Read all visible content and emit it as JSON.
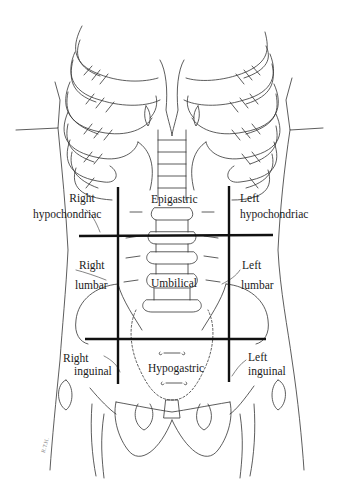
{
  "figure": {
    "type": "anatomical-diagram",
    "line_color": "#111111",
    "background": "#ffffff"
  },
  "regions": {
    "right_hypochondriac": {
      "line1": "Right",
      "line2": "hypochondriac"
    },
    "epigastric": {
      "label": "Epigastric"
    },
    "left_hypochondriac": {
      "line1": "Left",
      "line2": "hypochondriac"
    },
    "right_lumbar": {
      "line1": "Right",
      "line2": "lumbar"
    },
    "umbilical": {
      "label": "Umbilical"
    },
    "left_lumbar": {
      "line1": "Left",
      "line2": "lumbar"
    },
    "right_inguinal": {
      "line1": "Right",
      "line2": "inguinal"
    },
    "hypogastric": {
      "label": "Hypogastric"
    },
    "left_inguinal": {
      "line1": "Left",
      "line2": "inguinal"
    }
  },
  "grid_lines": {
    "vertical_left": {
      "x": 118,
      "y1": 187,
      "y2": 384
    },
    "vertical_right": {
      "x": 229,
      "y1": 186,
      "y2": 382
    },
    "horizontal_upper": {
      "y": 236,
      "x1": 79,
      "x2": 273
    },
    "horizontal_lower": {
      "y": 339,
      "x1": 85,
      "x2": 266
    }
  },
  "signature": {
    "text": "R.T.H."
  }
}
